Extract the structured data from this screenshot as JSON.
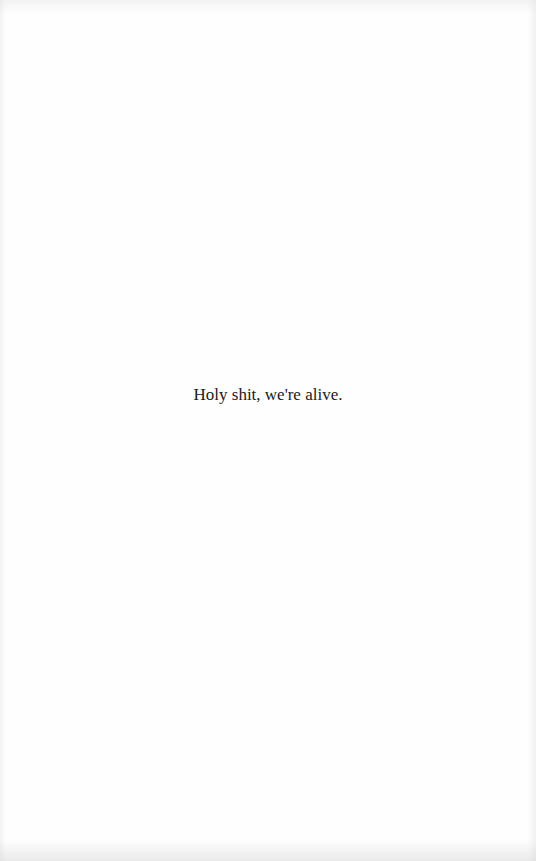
{
  "page": {
    "background_color": "#fefefe",
    "text_color": "#1a1a1a",
    "body": {
      "line": "Holy shit, we're alive."
    }
  }
}
